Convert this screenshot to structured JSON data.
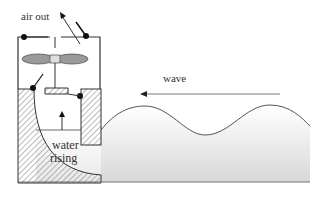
{
  "diagram": {
    "labels": {
      "air_out": "air out",
      "wave": "wave",
      "water_line1": "water",
      "water_line2": "rising"
    },
    "components": [
      "air chamber",
      "turbine/fan",
      "valves",
      "hatched concrete walls",
      "water column",
      "incoming wave"
    ],
    "colors": {
      "line": "#333333",
      "fan": "#9a9a9a",
      "hatch": "#666666",
      "water_top": "#ffffff",
      "water_bottom": "#dcdcdc"
    }
  }
}
